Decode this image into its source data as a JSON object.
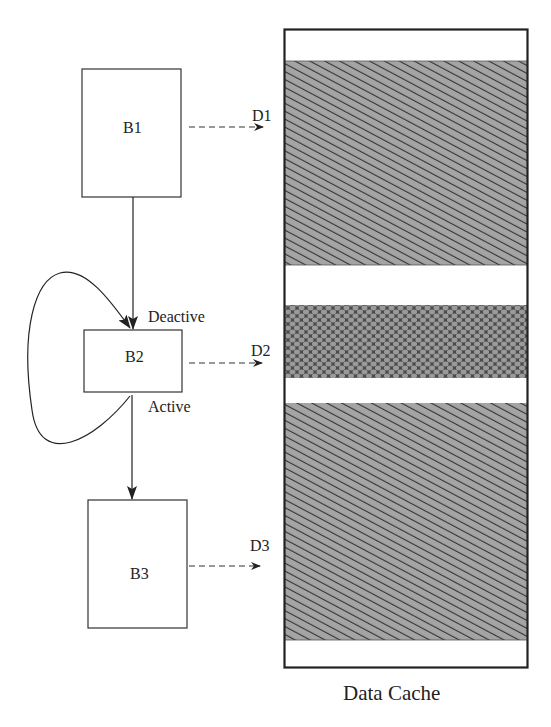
{
  "blocks": [
    {
      "id": "B1",
      "label": "B1"
    },
    {
      "id": "B2",
      "label": "B2"
    },
    {
      "id": "B3",
      "label": "B3"
    }
  ],
  "data_refs": [
    {
      "label": "D1",
      "from": "B1"
    },
    {
      "label": "D2",
      "from": "B2"
    },
    {
      "label": "D3",
      "from": "B3"
    }
  ],
  "edges": {
    "deactive_label": "Deactive",
    "active_label": "Active"
  },
  "cache": {
    "title": "Data Cache",
    "bands": [
      {
        "name": "empty-top",
        "fill": "white"
      },
      {
        "name": "D1-region",
        "fill": "diagonal-hatch"
      },
      {
        "name": "empty-1",
        "fill": "white"
      },
      {
        "name": "D2-region",
        "fill": "crosshatch-dark"
      },
      {
        "name": "empty-2",
        "fill": "white"
      },
      {
        "name": "D3-region",
        "fill": "diagonal-hatch"
      },
      {
        "name": "empty-bottom",
        "fill": "white"
      }
    ]
  },
  "colors": {
    "line": "#222222",
    "hatch_bg": "#9a9a9a",
    "hatch_line": "#333333",
    "cross_bg": "#555555"
  }
}
